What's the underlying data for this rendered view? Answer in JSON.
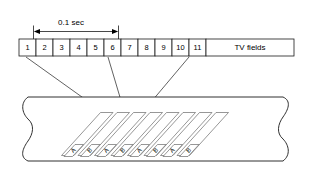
{
  "diagram": {
    "dimension": {
      "label": "0.1 sec",
      "spans_fields": 5,
      "from_field": "1",
      "to_field": "6"
    },
    "field_row": {
      "numbers": [
        "1",
        "2",
        "3",
        "4",
        "5",
        "6",
        "7",
        "8",
        "9",
        "10",
        "11"
      ],
      "trailing_label": "TV fields"
    },
    "callouts": [
      {
        "from_field": "1",
        "to_track_index": 0
      },
      {
        "from_field": "6",
        "to_track_index": 2
      },
      {
        "from_field": "11",
        "to_track_index": 3
      }
    ],
    "tape": {
      "tracks": [
        {
          "label": "A"
        },
        {
          "label": "B"
        },
        {
          "label": "A"
        },
        {
          "label": "B"
        },
        {
          "label": "A"
        },
        {
          "label": "B"
        },
        {
          "label": "A"
        },
        {
          "label": "B"
        }
      ]
    },
    "colors": {
      "line": "#1a1a1a",
      "track_line": "#6a6a6a",
      "leader": "#3a3a3a",
      "background": "#ffffff"
    }
  }
}
